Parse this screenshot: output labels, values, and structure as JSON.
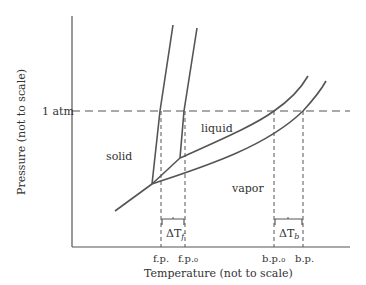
{
  "diagram": {
    "axes": {
      "y_label": "Pressure (not to scale)",
      "x_label": "Temperature (not to scale)",
      "reference_line_label": "1 atm"
    },
    "regions": {
      "solid": "solid",
      "liquid": "liquid",
      "vapor": "vapor"
    },
    "x_ticks": {
      "fp": "f.p.",
      "fp0": "f.p.₀",
      "bp0": "b.p.₀",
      "bp": "b.p."
    },
    "brackets": {
      "delta_tf": "ΔTf",
      "delta_tf_sym": "ΔT",
      "delta_tf_sub": "f",
      "delta_tb_sym": "ΔT",
      "delta_tb_sub": "b"
    },
    "colors": {
      "line": "#555555",
      "text": "#333333",
      "background": "#ffffff"
    }
  }
}
